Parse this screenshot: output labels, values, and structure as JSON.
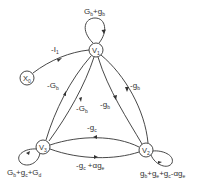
{
  "diagram": {
    "type": "signal-flow-graph",
    "nodes": [
      {
        "id": "V1",
        "label": "V",
        "sub": "1"
      },
      {
        "id": "V2",
        "label": "V",
        "sub": "2"
      },
      {
        "id": "V3",
        "label": "V",
        "sub": "3"
      },
      {
        "id": "X0",
        "label": "X",
        "sub": "0"
      }
    ],
    "edges": {
      "x0_v1": {
        "main": "-I",
        "sub": "1"
      },
      "self_v1": {
        "a": "G",
        "as": "b",
        "mid": "+g",
        "bs": "b"
      },
      "v1_v3_outer": {
        "main": "-G",
        "sub": "b"
      },
      "v1_v3_inner": {
        "main": "-G",
        "sub": "b"
      },
      "v1_v2_outer": {
        "main": "-g",
        "sub": "b"
      },
      "v1_v2_inner": {
        "main": "-g",
        "sub": "b"
      },
      "v3_v2_top": {
        "main": "-g",
        "sub": "c"
      },
      "v2_v3_bottom": {
        "p1": "-g",
        "s1": "c",
        "p2": " +αg",
        "s2": "e"
      },
      "self_v3": {
        "p1": "G",
        "s1": "b",
        "p2": "+g",
        "s2": "c",
        "p3": "+G",
        "s3": "d"
      },
      "self_v2": {
        "p1": "g",
        "s1": "b",
        "p2": "+g",
        "s2": "e",
        "p3": "+g",
        "s3": "c",
        "p4": "-αg",
        "s4": "e"
      }
    }
  }
}
